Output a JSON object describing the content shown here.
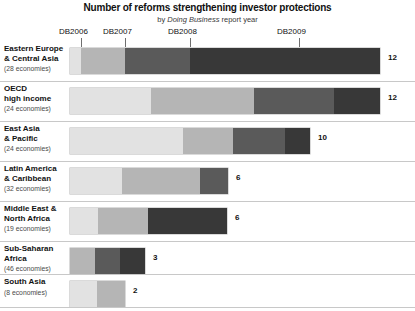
{
  "title": "Number of reforms strengthening investor protections",
  "subtitle_prefix": "by ",
  "subtitle_em": "Doing Business",
  "subtitle_suffix": " report year",
  "axis": {
    "ticks": [
      {
        "label": "DB2006",
        "x": 81
      },
      {
        "label": "DB2007",
        "x": 125
      },
      {
        "label": "DB2008",
        "x": 190
      },
      {
        "label": "DB2009",
        "x": 299
      }
    ]
  },
  "palette": {
    "db2006": "#e2e2e2",
    "db2007": "#b5b5b5",
    "db2008": "#5a5a5a",
    "db2009": "#383838",
    "separator": "#c8c8c8",
    "text": "#111111"
  },
  "chart_data": {
    "type": "bar",
    "title": "Number of reforms strengthening investor protections",
    "subtitle": "by Doing Business report year",
    "xlabel": "",
    "ylabel": "",
    "orientation": "horizontal",
    "stacked": true,
    "grid": false,
    "legend_position": "top",
    "series": [
      {
        "name": "DB2006",
        "color": "#e2e2e2"
      },
      {
        "name": "DB2007",
        "color": "#b5b5b5"
      },
      {
        "name": "DB2008",
        "color": "#5a5a5a"
      },
      {
        "name": "DB2009",
        "color": "#383838"
      }
    ],
    "categories": [
      "Eastern Europe & Central Asia",
      "OECD high income",
      "East Asia & Pacific",
      "Latin America & Caribbean",
      "Middle East & North Africa",
      "Sub-Saharan Africa",
      "South Asia"
    ],
    "totals": [
      12,
      12,
      10,
      6,
      6,
      3,
      2
    ]
  },
  "rows": [
    {
      "name_line1": "Eastern Europe",
      "name_line2": "& Central Asia",
      "economies": "(28 economies)",
      "total": "12",
      "segments": [
        {
          "series": "DB2006",
          "width": 11,
          "color": "#e2e2e2"
        },
        {
          "series": "DB2007",
          "width": 44,
          "color": "#b5b5b5"
        },
        {
          "series": "DB2008",
          "width": 65,
          "color": "#5a5a5a"
        },
        {
          "series": "DB2009",
          "width": 190,
          "color": "#383838"
        }
      ]
    },
    {
      "name_line1": "OECD",
      "name_line2": "high income",
      "economies": "(24 economies)",
      "total": "12",
      "segments": [
        {
          "series": "DB2006",
          "width": 81,
          "color": "#e2e2e2"
        },
        {
          "series": "DB2007",
          "width": 103,
          "color": "#b5b5b5"
        },
        {
          "series": "DB2008",
          "width": 80,
          "color": "#5a5a5a"
        },
        {
          "series": "DB2009",
          "width": 46,
          "color": "#383838"
        }
      ]
    },
    {
      "name_line1": "East Asia",
      "name_line2": "& Pacific",
      "economies": "(24 economies)",
      "total": "10",
      "segments": [
        {
          "series": "DB2006",
          "width": 113,
          "color": "#e2e2e2"
        },
        {
          "series": "DB2007",
          "width": 50,
          "color": "#b5b5b5"
        },
        {
          "series": "DB2008",
          "width": 52,
          "color": "#5a5a5a"
        },
        {
          "series": "DB2009",
          "width": 25,
          "color": "#383838"
        }
      ]
    },
    {
      "name_line1": "Latin America",
      "name_line2": "& Caribbean",
      "economies": "(32 economies)",
      "total": "6",
      "segments": [
        {
          "series": "DB2006",
          "width": 52,
          "color": "#e2e2e2"
        },
        {
          "series": "DB2007",
          "width": 78,
          "color": "#b5b5b5"
        },
        {
          "series": "DB2008",
          "width": 28,
          "color": "#5a5a5a"
        }
      ]
    },
    {
      "name_line1": "Middle East &",
      "name_line2": "North Africa",
      "economies": "(19 economies)",
      "total": "6",
      "segments": [
        {
          "series": "DB2006",
          "width": 28,
          "color": "#e2e2e2"
        },
        {
          "series": "DB2007",
          "width": 50,
          "color": "#b5b5b5"
        },
        {
          "series": "DB2008",
          "width": 79,
          "color": "#383838"
        }
      ]
    },
    {
      "name_line1": "Sub-Saharan",
      "name_line2": "Africa",
      "economies": "(46 economies)",
      "total": "3",
      "segments": [
        {
          "series": "DB2006",
          "width": 25,
          "color": "#b5b5b5"
        },
        {
          "series": "DB2007",
          "width": 25,
          "color": "#5a5a5a"
        },
        {
          "series": "DB2008",
          "width": 25,
          "color": "#383838"
        }
      ]
    },
    {
      "name_line1": "South Asia",
      "name_line2": "",
      "economies": "(8 economies)",
      "total": "2",
      "segments": [
        {
          "series": "DB2006",
          "width": 27,
          "color": "#e2e2e2"
        },
        {
          "series": "DB2007",
          "width": 28,
          "color": "#b5b5b5"
        }
      ]
    }
  ]
}
